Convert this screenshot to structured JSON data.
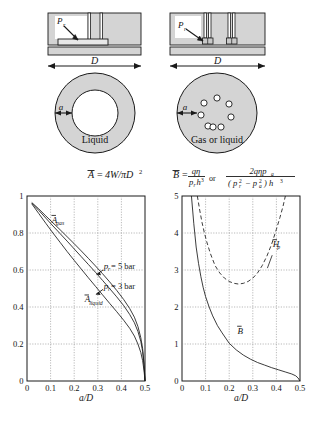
{
  "figure": {
    "background_color": "#ffffff",
    "shade_color": "#d4d4d4",
    "line_color": "#1a1a1a",
    "grid_color": "#8c8c8c"
  },
  "schematics": {
    "left": {
      "name": "single-recess-pad",
      "section_label_pressure": "P",
      "section_label_pressure_sub": "r",
      "diameter_label": "D",
      "gap_label": "a",
      "fluid_label": "Liquid"
    },
    "right": {
      "name": "multi-capillary-pad",
      "section_label_pressure": "P",
      "section_label_pressure_sub": "r",
      "diameter_label": "D",
      "gap_label": "a",
      "fluid_label": "Gas or liquid"
    }
  },
  "equations": {
    "left": {
      "lhs": "A",
      "lhs_bar": true,
      "eq": "=",
      "rhs": "4W/πD",
      "rhs_exp": "2"
    },
    "right": {
      "lhs": "B",
      "lhs_bar": true,
      "eq": "=",
      "frac1_num": "qη",
      "frac1_den_p": "p",
      "frac1_den_p_sub": "r",
      "frac1_den_h": "h",
      "frac1_den_h_exp": "3",
      "connector": "or",
      "frac2_num": "2qηp",
      "frac2_num_sub": "a",
      "frac2_den": "( p",
      "frac2_den_sub1": "r",
      "frac2_den_exp1": "2",
      "frac2_den_minus": "− p",
      "frac2_den_sub2": "a",
      "frac2_den_exp2": "2",
      "frac2_den_close": ") h",
      "frac2_den_h_exp": "3"
    }
  },
  "chart_data": [
    {
      "id": "load-coefficient-chart",
      "type": "line",
      "title": "",
      "xlabel": "a/D",
      "ylabel": "",
      "xlim": [
        0,
        0.5
      ],
      "ylim": [
        0,
        1
      ],
      "xticks": [
        "0",
        "0.1",
        "0.2",
        "0.3",
        "0.4",
        "0.5"
      ],
      "xtick_values": [
        0,
        0.1,
        0.2,
        0.3,
        0.4,
        0.5
      ],
      "yticks": [
        "0",
        "0.2",
        "0.4",
        "0.6",
        "0.8",
        "1"
      ],
      "ytick_values": [
        0,
        0.2,
        0.4,
        0.6,
        0.8,
        1
      ],
      "grid": true,
      "annotations": [
        {
          "text": "A",
          "bar": true,
          "sub": "gas",
          "x": 0.105,
          "y": 0.855
        },
        {
          "text": "A",
          "bar": true,
          "sub": "liquid",
          "x": 0.245,
          "y": 0.425
        },
        {
          "text": "p",
          "sub": "r",
          "rest": " = 5 bar",
          "x": 0.325,
          "y": 0.605
        },
        {
          "text": "p",
          "sub": "r",
          "rest": " = 3 bar",
          "x": 0.325,
          "y": 0.5
        }
      ],
      "series": [
        {
          "name": "A_gas (p_r = 5 bar)",
          "x": [
            0.02,
            0.05,
            0.08,
            0.11,
            0.14,
            0.17,
            0.2,
            0.23,
            0.26,
            0.29,
            0.32,
            0.35,
            0.38,
            0.41,
            0.435,
            0.455,
            0.47,
            0.482,
            0.49,
            0.496,
            0.5
          ],
          "values": [
            0.965,
            0.93,
            0.892,
            0.855,
            0.818,
            0.78,
            0.742,
            0.703,
            0.663,
            0.622,
            0.58,
            0.536,
            0.49,
            0.44,
            0.392,
            0.345,
            0.295,
            0.235,
            0.175,
            0.09,
            0.0
          ]
        },
        {
          "name": "A_gas (p_r = 3 bar)",
          "x": [
            0.02,
            0.05,
            0.08,
            0.11,
            0.14,
            0.17,
            0.2,
            0.23,
            0.26,
            0.29,
            0.32,
            0.35,
            0.38,
            0.41,
            0.435,
            0.455,
            0.47,
            0.482,
            0.49,
            0.496,
            0.5
          ],
          "values": [
            0.962,
            0.922,
            0.88,
            0.838,
            0.797,
            0.756,
            0.714,
            0.672,
            0.63,
            0.588,
            0.544,
            0.5,
            0.455,
            0.407,
            0.36,
            0.315,
            0.268,
            0.215,
            0.16,
            0.085,
            0.0
          ]
        },
        {
          "name": "A_liquid",
          "x": [
            0.02,
            0.05,
            0.08,
            0.11,
            0.14,
            0.17,
            0.2,
            0.23,
            0.26,
            0.29,
            0.32,
            0.35,
            0.38,
            0.41,
            0.435,
            0.455,
            0.47,
            0.482,
            0.49,
            0.496,
            0.5
          ],
          "values": [
            0.958,
            0.905,
            0.852,
            0.8,
            0.75,
            0.7,
            0.652,
            0.605,
            0.558,
            0.512,
            0.466,
            0.42,
            0.375,
            0.328,
            0.285,
            0.243,
            0.2,
            0.155,
            0.11,
            0.055,
            0.0
          ]
        }
      ]
    },
    {
      "id": "flow-and-stiffness-chart",
      "type": "line",
      "title": "",
      "xlabel": "a/D",
      "ylabel": "",
      "xlim": [
        0,
        0.5
      ],
      "ylim": [
        0,
        5
      ],
      "xticks": [
        "0",
        "0.1",
        "0.2",
        "0.3",
        "0.4",
        "0.5"
      ],
      "xtick_values": [
        0,
        0.1,
        0.2,
        0.3,
        0.4,
        0.5
      ],
      "yticks": [
        "0",
        "1",
        "2",
        "3",
        "4",
        "5"
      ],
      "ytick_values": [
        0,
        1,
        2,
        3,
        4,
        5
      ],
      "grid": true,
      "annotations": [
        {
          "text": "H",
          "bar": true,
          "sub": "p",
          "x": 0.385,
          "y": 3.62
        },
        {
          "text": "B",
          "bar": true,
          "sub": "",
          "x": 0.235,
          "y": 1.28
        }
      ],
      "series": [
        {
          "name": "B",
          "style": "solid",
          "x": [
            0.04,
            0.05,
            0.06,
            0.07,
            0.08,
            0.09,
            0.1,
            0.115,
            0.13,
            0.15,
            0.17,
            0.2,
            0.23,
            0.26,
            0.29,
            0.32,
            0.35,
            0.38,
            0.41,
            0.44,
            0.465,
            0.482,
            0.492,
            0.5
          ],
          "values": [
            5.0,
            4.25,
            3.62,
            3.18,
            2.82,
            2.52,
            2.28,
            2.0,
            1.76,
            1.5,
            1.3,
            1.02,
            0.84,
            0.7,
            0.59,
            0.5,
            0.43,
            0.36,
            0.3,
            0.24,
            0.19,
            0.14,
            0.08,
            0.0
          ]
        },
        {
          "name": "H_p",
          "style": "dashed",
          "x": [
            0.065,
            0.075,
            0.085,
            0.095,
            0.105,
            0.12,
            0.14,
            0.16,
            0.18,
            0.2,
            0.22,
            0.24,
            0.26,
            0.28,
            0.3,
            0.32,
            0.34,
            0.36,
            0.38,
            0.4,
            0.415,
            0.428,
            0.438
          ],
          "values": [
            5.0,
            4.62,
            4.28,
            4.0,
            3.76,
            3.45,
            3.12,
            2.92,
            2.78,
            2.69,
            2.64,
            2.62,
            2.64,
            2.69,
            2.78,
            2.92,
            3.12,
            3.38,
            3.7,
            4.1,
            4.42,
            4.72,
            5.0
          ]
        }
      ]
    }
  ]
}
